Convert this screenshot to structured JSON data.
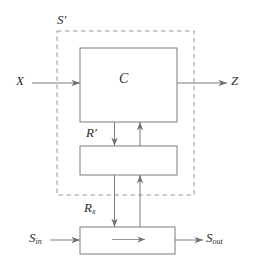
{
  "figure": {
    "kind": "block-diagram",
    "background_color": "#ffffff",
    "stroke_color": "#6e6e6e",
    "text_color": "#2b2b2b",
    "width": 255,
    "height": 272
  },
  "labels": {
    "system_boundary": "S′",
    "input": "X",
    "controller": "C",
    "output": "Z",
    "register_prime": "R′",
    "register_x_base": "R",
    "register_x_sub": "x",
    "stream_in_base": "S",
    "stream_in_sub": "in",
    "stream_out_base": "S",
    "stream_out_sub": "out"
  },
  "blocks": [
    {
      "name": "controller-block",
      "label": "C",
      "x": 80,
      "y": 48,
      "w": 97,
      "h": 74
    },
    {
      "name": "register-prime-block",
      "label": "",
      "x": 80,
      "y": 146,
      "w": 97,
      "h": 29
    },
    {
      "name": "register-x-block",
      "label": "",
      "x": 80,
      "y": 227,
      "w": 95,
      "h": 27
    }
  ],
  "boundary": {
    "name": "s-prime-dashed-boundary",
    "x": 57,
    "y": 31,
    "w": 137,
    "h": 164,
    "style": "dashed"
  },
  "connections": [
    {
      "name": "x-input-arrow",
      "from": "X",
      "to": "C",
      "direction": "right"
    },
    {
      "name": "z-output-arrow",
      "from": "C",
      "to": "Z",
      "direction": "right"
    },
    {
      "name": "c-to-rprime-arrow",
      "from": "C",
      "to": "R′",
      "direction": "down"
    },
    {
      "name": "rprime-to-c-arrow",
      "from": "R′",
      "to": "C",
      "direction": "up"
    },
    {
      "name": "rprime-to-rx-arrow",
      "from": "R′",
      "to": "Rx",
      "direction": "down"
    },
    {
      "name": "rx-to-rprime-arrow",
      "from": "Rx",
      "to": "R′",
      "direction": "up"
    },
    {
      "name": "sin-input-arrow",
      "from": "S_in",
      "to": "Rx",
      "direction": "right"
    },
    {
      "name": "rx-internal-arrow",
      "from": "Rx",
      "to": "Rx",
      "direction": "right"
    },
    {
      "name": "sout-output-arrow",
      "from": "Rx",
      "to": "S_out",
      "direction": "right"
    }
  ]
}
